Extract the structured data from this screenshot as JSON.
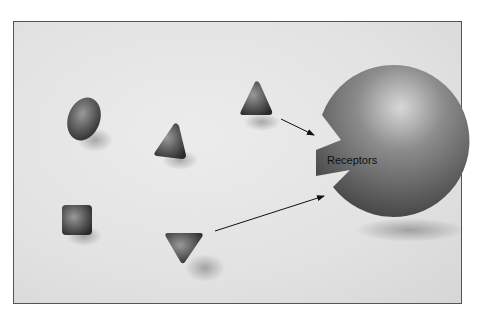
{
  "diagram": {
    "title": "",
    "receptor": {
      "label": "Receptors",
      "shape": "sphere-with-notches"
    },
    "molecules": [
      {
        "shape": "ellipse",
        "name": "oval-molecule"
      },
      {
        "shape": "triangle-up",
        "name": "triangle-molecule-left"
      },
      {
        "shape": "triangle-up",
        "name": "triangle-molecule-top"
      },
      {
        "shape": "square",
        "name": "square-molecule"
      },
      {
        "shape": "triangle-down",
        "name": "inverted-triangle-molecule"
      }
    ],
    "arrows": [
      {
        "from": "triangle-molecule-top",
        "to": "upper-receptor-notch"
      },
      {
        "from": "inverted-triangle-molecule",
        "to": "lower-receptor-notch"
      }
    ],
    "colors": {
      "background": "#e4e4e4",
      "shape_dark": "#3a3a3a",
      "shape_mid": "#8a8a8a",
      "border": "#555555"
    }
  }
}
